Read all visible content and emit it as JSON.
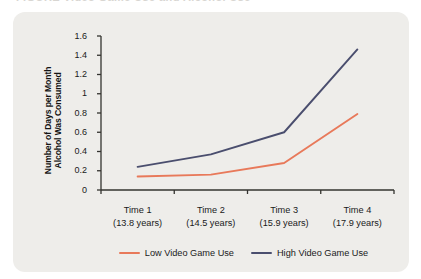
{
  "page": {
    "scrap_text": "FIGURE   Video Game Use and Alcohol Use"
  },
  "chart_data": {
    "type": "line",
    "title": "",
    "xlabel": "",
    "ylabel": "Number of Days per Month Alcohol Was Consumed",
    "ylabel_line1": "Number of Days per Month",
    "ylabel_line2": "Alcohol Was Consumed",
    "categories": [
      "Time 1",
      "Time 2",
      "Time 3",
      "Time 4"
    ],
    "category_sublabels": [
      "(13.8 years)",
      "(14.5 years)",
      "(15.9 years)",
      "(17.9 years)"
    ],
    "ylim": [
      0,
      1.6
    ],
    "yticks": [
      "0",
      "0.2",
      "0.4",
      "0.6",
      "0.8",
      "1",
      "1.2",
      "1.4",
      "1.6"
    ],
    "ytick_values": [
      0,
      0.2,
      0.4,
      0.6,
      0.8,
      1,
      1.2,
      1.4,
      1.6
    ],
    "grid": false,
    "legend_position": "bottom",
    "series": [
      {
        "name": "Low Video Game Use",
        "color": "#e8795a",
        "values": [
          0.14,
          0.16,
          0.28,
          0.79
        ]
      },
      {
        "name": "High Video Game Use",
        "color": "#4a4e6e",
        "values": [
          0.24,
          0.37,
          0.6,
          1.46
        ]
      }
    ]
  },
  "colors": {
    "panel_background": "#eeedea",
    "axis": "#33332f",
    "text": "#1a1a1a",
    "low_use": "#e8795a",
    "high_use": "#4a4e6e"
  }
}
